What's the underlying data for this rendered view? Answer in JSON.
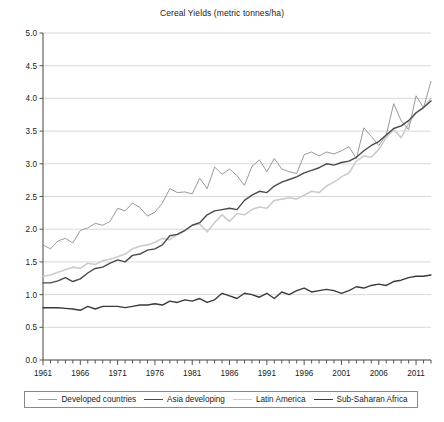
{
  "chart_data": {
    "type": "line",
    "title": "Cereal Yields (metric tonnes/ha)",
    "xlabel": "",
    "ylabel": "",
    "xlim": [
      1961,
      2013
    ],
    "ylim": [
      0.0,
      5.0
    ],
    "grid": true,
    "legend_position": "bottom",
    "y_ticks": [
      "0.0",
      "0.5",
      "1.0",
      "1.5",
      "2.0",
      "2.5",
      "3.0",
      "3.5",
      "4.0",
      "4.5",
      "5.0"
    ],
    "y_tick_values": [
      0.0,
      0.5,
      1.0,
      1.5,
      2.0,
      2.5,
      3.0,
      3.5,
      4.0,
      4.5,
      5.0
    ],
    "x_tick_labels": [
      "1961",
      "1966",
      "1971",
      "1976",
      "1981",
      "1986",
      "1991",
      "1996",
      "2001",
      "2006",
      "2011"
    ],
    "x_tick_values": [
      1961,
      1966,
      1971,
      1976,
      1981,
      1986,
      1991,
      1996,
      2001,
      2006,
      2011
    ],
    "x": [
      1961,
      1962,
      1963,
      1964,
      1965,
      1966,
      1967,
      1968,
      1969,
      1970,
      1971,
      1972,
      1973,
      1974,
      1975,
      1976,
      1977,
      1978,
      1979,
      1980,
      1981,
      1982,
      1983,
      1984,
      1985,
      1986,
      1987,
      1988,
      1989,
      1990,
      1991,
      1992,
      1993,
      1994,
      1995,
      1996,
      1997,
      1998,
      1999,
      2000,
      2001,
      2002,
      2003,
      2004,
      2005,
      2006,
      2007,
      2008,
      2009,
      2010,
      2011,
      2012,
      2013
    ],
    "series": [
      {
        "name": "Developed countries",
        "color": "#9a9a9a",
        "width": 1.0,
        "values": [
          1.76,
          1.7,
          1.82,
          1.86,
          1.79,
          1.98,
          2.02,
          2.09,
          2.06,
          2.12,
          2.32,
          2.28,
          2.4,
          2.33,
          2.2,
          2.26,
          2.4,
          2.62,
          2.56,
          2.57,
          2.54,
          2.78,
          2.62,
          2.95,
          2.84,
          2.92,
          2.82,
          2.67,
          2.96,
          3.06,
          2.88,
          3.08,
          2.92,
          2.88,
          2.85,
          3.14,
          3.18,
          3.12,
          3.18,
          3.15,
          3.2,
          3.26,
          3.08,
          3.55,
          3.42,
          3.28,
          3.44,
          3.92,
          3.66,
          3.52,
          4.04,
          3.86,
          4.26
        ]
      },
      {
        "name": "Asia developing",
        "color": "#4a4a4a",
        "width": 1.4,
        "values": [
          1.18,
          1.18,
          1.21,
          1.26,
          1.2,
          1.24,
          1.33,
          1.4,
          1.42,
          1.48,
          1.53,
          1.5,
          1.6,
          1.62,
          1.68,
          1.7,
          1.76,
          1.9,
          1.92,
          1.98,
          2.06,
          2.1,
          2.22,
          2.28,
          2.3,
          2.32,
          2.3,
          2.44,
          2.52,
          2.58,
          2.56,
          2.66,
          2.72,
          2.76,
          2.8,
          2.86,
          2.9,
          2.94,
          3.0,
          2.98,
          3.02,
          3.04,
          3.1,
          3.2,
          3.28,
          3.34,
          3.44,
          3.54,
          3.58,
          3.66,
          3.78,
          3.86,
          3.96
        ]
      },
      {
        "name": "Latin America",
        "color": "#cccccc",
        "width": 1.6,
        "values": [
          1.28,
          1.3,
          1.34,
          1.38,
          1.42,
          1.4,
          1.48,
          1.46,
          1.52,
          1.54,
          1.58,
          1.62,
          1.7,
          1.74,
          1.76,
          1.8,
          1.86,
          1.84,
          1.92,
          1.98,
          2.06,
          2.08,
          1.96,
          2.1,
          2.22,
          2.12,
          2.24,
          2.22,
          2.3,
          2.34,
          2.32,
          2.44,
          2.46,
          2.48,
          2.46,
          2.52,
          2.58,
          2.56,
          2.66,
          2.72,
          2.8,
          2.86,
          3.04,
          3.12,
          3.1,
          3.22,
          3.4,
          3.52,
          3.4,
          3.62,
          3.78,
          3.86,
          4.0
        ]
      },
      {
        "name": "Sub-Saharan Africa",
        "color": "#3a3a3a",
        "width": 1.4,
        "values": [
          0.8,
          0.8,
          0.8,
          0.79,
          0.78,
          0.76,
          0.82,
          0.78,
          0.82,
          0.82,
          0.82,
          0.8,
          0.82,
          0.84,
          0.84,
          0.86,
          0.84,
          0.9,
          0.88,
          0.92,
          0.9,
          0.94,
          0.88,
          0.92,
          1.02,
          0.98,
          0.94,
          1.02,
          1.0,
          0.96,
          1.02,
          0.94,
          1.04,
          1.0,
          1.06,
          1.1,
          1.04,
          1.06,
          1.08,
          1.06,
          1.02,
          1.06,
          1.12,
          1.1,
          1.14,
          1.16,
          1.14,
          1.2,
          1.22,
          1.26,
          1.28,
          1.28,
          1.3
        ]
      }
    ]
  },
  "legend": {
    "items": [
      {
        "label": "Developed countries",
        "color": "#9a9a9a"
      },
      {
        "label": "Asia developing",
        "color": "#4a4a4a"
      },
      {
        "label": "Latin America",
        "color": "#cccccc"
      },
      {
        "label": "Sub-Saharan Africa",
        "color": "#3a3a3a"
      }
    ]
  }
}
